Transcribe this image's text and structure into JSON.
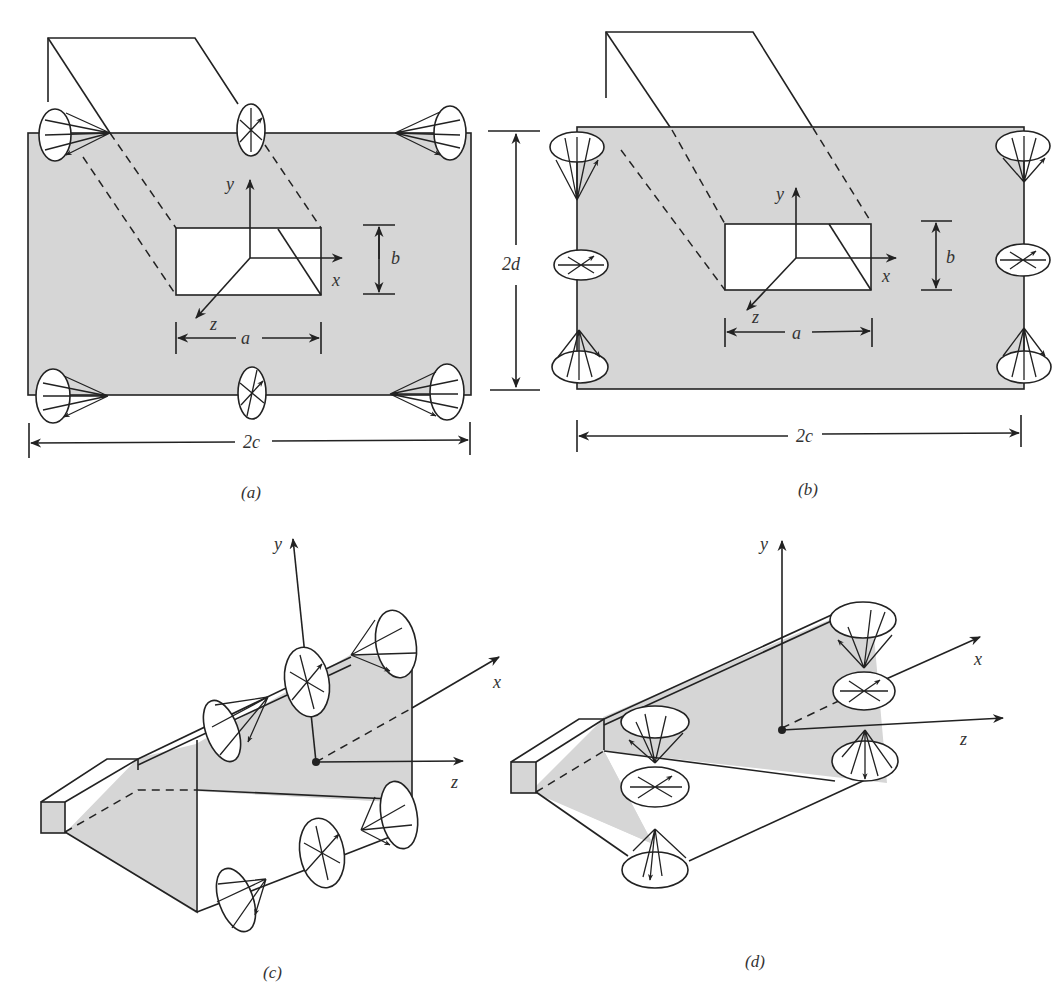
{
  "figure": {
    "panels": [
      {
        "id": "a",
        "caption": "(a)",
        "axes": {
          "x": "x",
          "y": "y",
          "z": "z"
        },
        "dimensions": {
          "hole_width": "a",
          "hole_height": "b",
          "plate_width": "2c",
          "plate_height": "2d"
        },
        "source_positions": [
          "top-left corner cone",
          "top-center disc",
          "top-right corner cone",
          "bottom-left corner cone",
          "bottom-center disc",
          "bottom-right corner cone"
        ]
      },
      {
        "id": "b",
        "caption": "(b)",
        "axes": {
          "x": "x",
          "y": "y",
          "z": "z"
        },
        "dimensions": {
          "hole_width": "a",
          "hole_height": "b",
          "plate_width": "2c"
        },
        "source_positions": [
          "left-top cone",
          "left-middle disc",
          "left-bottom cone",
          "right-top cone",
          "right-middle disc",
          "right-bottom cone"
        ]
      },
      {
        "id": "c",
        "caption": "(c)",
        "axes": {
          "x": "x",
          "y": "y",
          "z": "z"
        },
        "source_positions": [
          "upper edge cone (left)",
          "upper edge disc",
          "upper edge cone (right)",
          "lower edge cone (left)",
          "lower edge disc",
          "lower edge cone (right)"
        ]
      },
      {
        "id": "d",
        "caption": "(d)",
        "axes": {
          "x": "x",
          "y": "y",
          "z": "z"
        },
        "source_positions": [
          "left upper cone",
          "left middle disc",
          "left lower cone",
          "right upper cone",
          "right middle disc",
          "right lower cone"
        ]
      }
    ]
  },
  "colors": {
    "plate_fill": "#d6d6d6",
    "line": "#222222",
    "background": "#ffffff"
  }
}
